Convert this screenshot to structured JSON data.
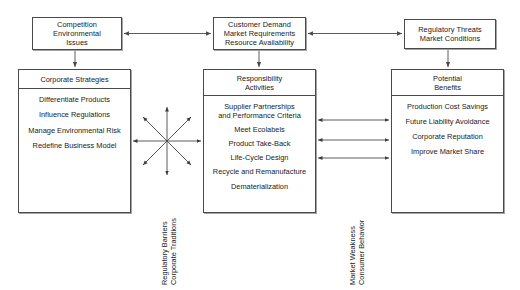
{
  "diagram": {
    "background_color": "#ffffff",
    "line_color": "#4a4a4a",
    "text_color": "#1a1a1a"
  },
  "top_boxes": [
    {
      "id": "competition",
      "text": "Competition\nEnvironmental\nIssues"
    },
    {
      "id": "customer",
      "text": "Customer Demand\nMarket Requirements\nResource Availability"
    },
    {
      "id": "regulatory",
      "text": "Regulatory Threats\nMarket Conditions"
    }
  ],
  "main_boxes": [
    {
      "id": "strategies",
      "header": "Corporate Strategies",
      "items": [
        "Differentiate Products",
        "Influence Regulations",
        "Manage Environmental Risk",
        "Redefine Business Model"
      ]
    },
    {
      "id": "activities",
      "header": "Responsibility\nActivities",
      "items": [
        "Supplier Partnerships\nand Performance Criteria",
        "Meet Ecolabels",
        "Product Take-Back",
        "Life-Cycle Design",
        "Recycle and Remanufacture",
        "Dematerialization"
      ]
    },
    {
      "id": "benefits",
      "header": "Potential\nBenefits",
      "items": [
        "Production Cost Savings",
        "Future Liability Avoidance",
        "Corporate Reputation",
        "Improve Market Share"
      ]
    }
  ],
  "side_labels": [
    {
      "id": "barriers",
      "text": "Regulatory Barriers\nCorporate Traditions"
    },
    {
      "id": "market",
      "text": "Market Weakness\nConsumer Behavior"
    }
  ],
  "connectors": {
    "top_horizontal": [
      {
        "from": "competition",
        "to": "customer",
        "style": "double-arrow"
      },
      {
        "from": "regulatory",
        "to": "customer",
        "style": "double-arrow"
      }
    ],
    "vertical_down": [
      {
        "from": "competition",
        "to": "strategies",
        "style": "single-arrow"
      },
      {
        "from": "customer",
        "to": "activities",
        "style": "single-arrow"
      },
      {
        "from": "regulatory",
        "to": "benefits",
        "style": "single-arrow"
      }
    ],
    "starburst": {
      "between": [
        "strategies",
        "activities"
      ],
      "rays": 8,
      "style": "double-arrow"
    },
    "right_links": [
      {
        "from": "activities",
        "to": "benefits",
        "style": "double-arrow"
      },
      {
        "from": "activities",
        "to": "benefits",
        "style": "double-arrow"
      },
      {
        "from": "activities",
        "to": "benefits",
        "style": "double-arrow"
      }
    ]
  }
}
